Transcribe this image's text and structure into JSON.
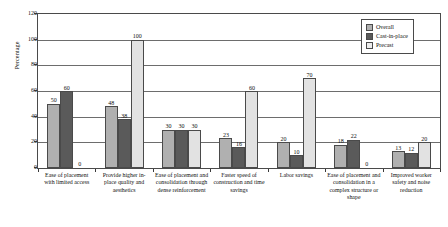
{
  "chart_data": {
    "type": "bar",
    "title": "",
    "xlabel": "",
    "ylabel": "Percentage",
    "ylim": [
      0,
      120
    ],
    "ytick_labels": [
      "120",
      "100",
      "80",
      "60",
      "40",
      "20",
      "0"
    ],
    "ytick_values": [
      120,
      100,
      80,
      60,
      40,
      20,
      0
    ],
    "grid": true,
    "legend_position": "top-right",
    "categories": [
      "Ease of placement with limited access",
      "Provide higher in-place quality and aesthetics",
      "Ease of placement and consolidation through dense reinforcement",
      "Faster speed of construction and time savings",
      "Labor savings",
      "Ease of placement and consolidation in a complex structure or shape",
      "Improved worker safety and noise reduction"
    ],
    "series": [
      {
        "name": "Overall",
        "color": "#b0b0b0",
        "values": [
          50,
          48,
          30,
          23,
          20,
          18,
          13
        ]
      },
      {
        "name": "Cast-in-place",
        "color": "#5a5a5a",
        "values": [
          60,
          38,
          30,
          16,
          10,
          22,
          12
        ]
      },
      {
        "name": "Precast",
        "color": "#e2e2e2",
        "values": [
          0,
          100,
          30,
          60,
          70,
          0,
          20
        ]
      }
    ]
  },
  "legend": {
    "items": [
      {
        "label": "Overall"
      },
      {
        "label": "Cast-in-place"
      },
      {
        "label": "Precast"
      }
    ]
  }
}
